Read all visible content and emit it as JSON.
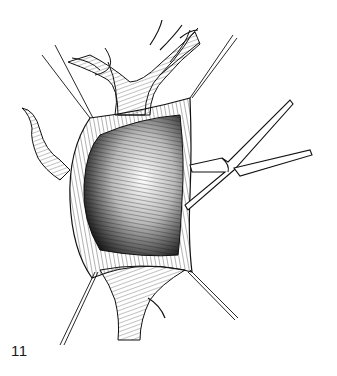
{
  "figure": {
    "number": "11",
    "elements": [
      "vessel-branches",
      "opened-cavity",
      "stay-sutures",
      "clamp"
    ],
    "colors": {
      "ink": "#111111",
      "background": "#ffffff"
    }
  }
}
